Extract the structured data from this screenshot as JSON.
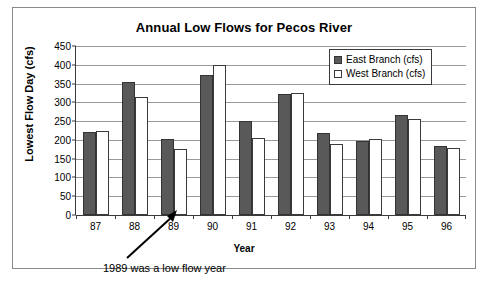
{
  "chart_data": {
    "type": "bar",
    "title": "Annual Low Flows for Pecos River",
    "xlabel": "Year",
    "ylabel": "Lowest Flow Day (cfs)",
    "categories": [
      "87",
      "88",
      "89",
      "90",
      "91",
      "92",
      "93",
      "94",
      "95",
      "96"
    ],
    "series": [
      {
        "name": "East Branch (cfs)",
        "color": "#595959",
        "values": [
          220,
          355,
          202,
          373,
          250,
          323,
          218,
          196,
          265,
          184
        ]
      },
      {
        "name": "West Branch (cfs)",
        "color": "#ffffff",
        "values": [
          223,
          315,
          176,
          400,
          206,
          325,
          189,
          203,
          255,
          179
        ]
      }
    ],
    "ylim": [
      0,
      450
    ],
    "ytick_step": 50,
    "yticks": [
      450,
      400,
      350,
      300,
      250,
      200,
      150,
      100,
      50,
      0
    ],
    "grid": true,
    "legend_position": "top-right",
    "annotations": [
      {
        "text": "1989 was a low flow year",
        "points_to": "89",
        "arrow": true
      }
    ]
  }
}
